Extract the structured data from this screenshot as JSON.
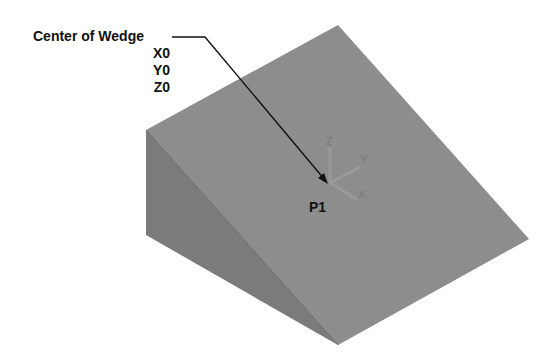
{
  "callout": {
    "title": "Center of Wedge",
    "coords": [
      "X0",
      "Y0",
      "Z0"
    ]
  },
  "point_label": "P1",
  "axes": {
    "x": "X",
    "y": "Y",
    "z": "Z"
  },
  "colors": {
    "top_face": "#8c8c8c",
    "left_face": "#7a7a7a",
    "front_face": "#737373",
    "leader": "#111111"
  }
}
